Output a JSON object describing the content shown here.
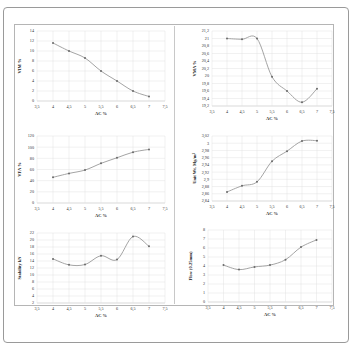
{
  "chart_data": [
    {
      "type": "line",
      "id": "vim",
      "xlabel": "AC %",
      "ylabel": "VIM %",
      "x": [
        4,
        4.5,
        5,
        5.5,
        6,
        6.5,
        7
      ],
      "values": [
        11.6,
        10,
        8.6,
        6,
        4,
        2,
        0.9
      ],
      "xlim": [
        3.5,
        7.5
      ],
      "ylim": [
        0,
        14
      ],
      "xticks": [
        "3,5",
        "4",
        "4,5",
        "5",
        "5,5",
        "6",
        "6,5",
        "7",
        "7,5"
      ],
      "yticks": [
        "0",
        "2",
        "4",
        "6",
        "8",
        "10",
        "12",
        "14"
      ],
      "grid": true
    },
    {
      "type": "line",
      "id": "vma",
      "xlabel": "AC %",
      "ylabel": "VMA %",
      "x": [
        4,
        4.5,
        5,
        5.5,
        6,
        6.5,
        7
      ],
      "values": [
        21,
        20.98,
        21,
        19.98,
        19.6,
        19.3,
        19.66
      ],
      "xlim": [
        3.5,
        7.5
      ],
      "ylim": [
        19.2,
        21.2
      ],
      "xticks": [
        "3,5",
        "4",
        "4,5",
        "5",
        "5,5",
        "6",
        "6,5",
        "7",
        "7,5"
      ],
      "yticks": [
        "19,2",
        "19,4",
        "19,6",
        "19,8",
        "20",
        "20,2",
        "20,4",
        "20,6",
        "20,8",
        "21",
        "21,2"
      ],
      "grid": true
    },
    {
      "type": "line",
      "id": "vfa",
      "xlabel": "AC %",
      "ylabel": "VFA %",
      "x": [
        4,
        4.5,
        5,
        5.5,
        6,
        6.5,
        7
      ],
      "values": [
        46,
        53,
        59,
        71,
        81,
        91,
        96
      ],
      "xlim": [
        3.5,
        7.5
      ],
      "ylim": [
        0,
        120
      ],
      "xticks": [
        "3,5",
        "4",
        "4,5",
        "5",
        "5,5",
        "6",
        "6,5",
        "7",
        "7,5"
      ],
      "yticks": [
        "0",
        "20",
        "40",
        "60",
        "80",
        "100",
        "120"
      ],
      "grid": true
    },
    {
      "type": "line",
      "id": "unit_wt",
      "xlabel": "AC %",
      "ylabel": "Unit Wt. Mg/m³",
      "x": [
        4,
        4.5,
        5,
        5.5,
        6,
        6.5,
        7
      ],
      "values": [
        2.865,
        2.882,
        2.893,
        2.95,
        2.978,
        3.006,
        3.007
      ],
      "xlim": [
        3.5,
        7.5
      ],
      "ylim": [
        2.84,
        3.02
      ],
      "xticks": [
        "3,5",
        "4",
        "4,5",
        "5",
        "5,5",
        "6",
        "6,5",
        "7",
        "7,5"
      ],
      "yticks": [
        "2,84",
        "2,86",
        "2,88",
        "2,9",
        "2,92",
        "2,94",
        "2,96",
        "2,98",
        "3",
        "3,02"
      ],
      "grid": true
    },
    {
      "type": "line",
      "id": "stability",
      "xlabel": "AC %",
      "ylabel": "Stability kN",
      "x": [
        4,
        4.5,
        5,
        5.5,
        6,
        6.5,
        7
      ],
      "values": [
        14.6,
        12.9,
        13,
        15.5,
        14.4,
        21,
        18.2
      ],
      "xlim": [
        3.5,
        7.5
      ],
      "ylim": [
        2,
        22
      ],
      "xticks": [
        "3,5",
        "4",
        "4,5",
        "5",
        "5,5",
        "6",
        "6,5",
        "7",
        "7,5"
      ],
      "yticks": [
        "2",
        "4",
        "6",
        "8",
        "10",
        "12",
        "14",
        "16",
        "18",
        "20",
        "22"
      ],
      "grid": true
    },
    {
      "type": "line",
      "id": "flow",
      "xlabel": "AC %",
      "ylabel": "Flow (0.25mm)",
      "x": [
        4,
        4.5,
        5,
        5.5,
        6,
        6.5,
        7
      ],
      "values": [
        4.1,
        3.6,
        3.9,
        4.1,
        4.7,
        6.1,
        6.9
      ],
      "xlim": [
        3.5,
        7.5
      ],
      "ylim": [
        0,
        8
      ],
      "xticks": [
        "3,5",
        "4",
        "4,5",
        "5",
        "5,5",
        "6",
        "6,5",
        "7",
        "7,5"
      ],
      "yticks": [
        "0",
        "1",
        "2",
        "3",
        "4",
        "5",
        "6",
        "7",
        "8"
      ],
      "grid": true
    }
  ],
  "colors": {
    "line": "#9a9a9a",
    "marker": "#6a6a6a",
    "grid": "#e2e2e2",
    "axis": "#b0b0b0"
  }
}
